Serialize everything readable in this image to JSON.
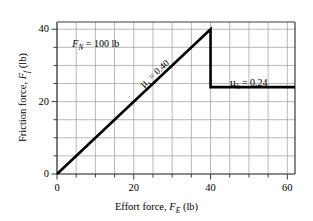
{
  "chart_data": {
    "type": "line",
    "title": "",
    "xlabel": "Effort force, F_E (lb)",
    "ylabel": "Friction force, F_f (lb)",
    "xlim": [
      0,
      62
    ],
    "ylim": [
      0,
      42
    ],
    "grid": true,
    "legend_position": "none",
    "major_tick_step": 20,
    "minor_tick_step": 5,
    "xticks": [
      0,
      20,
      40,
      60
    ],
    "yticks": [
      0,
      20,
      40
    ],
    "xtick_labels": [
      "0",
      "20",
      "40",
      "60"
    ],
    "ytick_labels": [
      "0",
      "20",
      "40"
    ],
    "series": [
      {
        "name": "Static friction (rising)",
        "x": [
          0,
          40
        ],
        "y": [
          0,
          40
        ]
      },
      {
        "name": "Breakaway drop",
        "x": [
          40,
          40
        ],
        "y": [
          40,
          24
        ]
      },
      {
        "name": "Kinetic friction (constant)",
        "x": [
          40,
          62
        ],
        "y": [
          24,
          24
        ]
      }
    ],
    "annotations": [
      {
        "id": "normal-force",
        "text": "F_N = 100 lb",
        "x": 4,
        "y": 37.3
      },
      {
        "id": "static-coefficient",
        "text": "μ_s = 0.40",
        "x": 21,
        "y": 25.5,
        "rotation": -42.5
      },
      {
        "id": "kinetic-coefficient",
        "text": "μ_k = 0.24",
        "x": 45,
        "y": 26.5
      }
    ],
    "slope_static": 0.4,
    "slope_kinetic_value": 24,
    "peak_value": 40,
    "breakaway_x": 40
  },
  "labels": {
    "y_axis": {
      "prefix": "Friction force, ",
      "symbol": "F",
      "subscript": "f",
      "unit": " (lb)"
    },
    "x_axis": {
      "prefix": "Effort force, ",
      "symbol": "F",
      "subscript": "E",
      "unit": " (lb)"
    },
    "normal_force": {
      "symbol": "F",
      "subscript": "N",
      "rest": " = 100 lb"
    },
    "mu_static": {
      "symbol": "μ",
      "subscript": "s",
      "rest": " = 0.40"
    },
    "mu_kinetic": {
      "symbol": "μ",
      "subscript": "k",
      "rest": " = 0.24"
    }
  },
  "ticks": {
    "x": [
      "0",
      "20",
      "40",
      "60"
    ],
    "y": [
      "0",
      "20",
      "40"
    ]
  },
  "style": {
    "grid_color": "#9a9a9a",
    "axis_color": "#3a3a3a",
    "curve_color": "#000000",
    "background": "#ffffff"
  }
}
